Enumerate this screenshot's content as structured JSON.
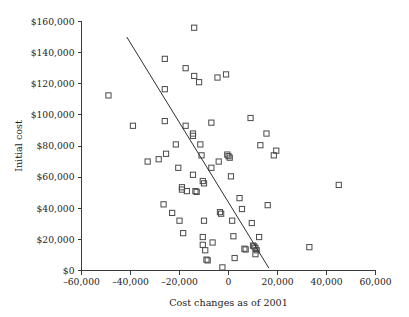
{
  "chart_data": {
    "type": "scatter",
    "title": "",
    "xlabel": "Cost changes as of 2001",
    "ylabel": "Initial cost",
    "xlim": [
      -60000,
      60000
    ],
    "ylim": [
      0,
      160000
    ],
    "grid": false,
    "legend": null,
    "xticks": [
      -60000,
      -40000,
      -20000,
      0,
      20000,
      40000,
      60000
    ],
    "xticklabels": [
      "–60,000",
      "–40,000",
      "–20,000",
      "0",
      "20,000",
      "40,000",
      "60,000"
    ],
    "yticks": [
      0,
      20000,
      40000,
      60000,
      80000,
      100000,
      120000,
      140000,
      160000
    ],
    "yticklabels": [
      "$0",
      "$20,000",
      "$40,000",
      "$60,000",
      "$80,000",
      "$100,000",
      "$120,000",
      "$140,000",
      "$160,000"
    ],
    "marker": "open-square",
    "marker_color": "#4a4a4a",
    "trendline": {
      "show": true,
      "x_start": -41500,
      "y_start": 150000,
      "x_end": 16500,
      "y_end": 1500,
      "color": "#2e2e2e"
    },
    "points": [
      {
        "x": -49000,
        "y": 112500
      },
      {
        "x": -39000,
        "y": 93000
      },
      {
        "x": -33000,
        "y": 70000
      },
      {
        "x": -28500,
        "y": 71500
      },
      {
        "x": -26000,
        "y": 136000
      },
      {
        "x": -26000,
        "y": 116500
      },
      {
        "x": -26000,
        "y": 96000
      },
      {
        "x": -25500,
        "y": 75000
      },
      {
        "x": -26500,
        "y": 42500
      },
      {
        "x": -23000,
        "y": 37000
      },
      {
        "x": -21500,
        "y": 81000
      },
      {
        "x": -20500,
        "y": 66000
      },
      {
        "x": -20000,
        "y": 32000
      },
      {
        "x": -19000,
        "y": 53500
      },
      {
        "x": -19000,
        "y": 52000
      },
      {
        "x": -17500,
        "y": 130000
      },
      {
        "x": -17500,
        "y": 93000
      },
      {
        "x": -17000,
        "y": 51000
      },
      {
        "x": -18500,
        "y": 24000
      },
      {
        "x": -14000,
        "y": 156000
      },
      {
        "x": -14000,
        "y": 125000
      },
      {
        "x": -14500,
        "y": 88000
      },
      {
        "x": -14500,
        "y": 86500
      },
      {
        "x": -14500,
        "y": 61500
      },
      {
        "x": -13500,
        "y": 51000
      },
      {
        "x": -13000,
        "y": 50500
      },
      {
        "x": -12000,
        "y": 121000
      },
      {
        "x": -11500,
        "y": 81000
      },
      {
        "x": -11000,
        "y": 74000
      },
      {
        "x": -10500,
        "y": 57500
      },
      {
        "x": -10000,
        "y": 56000
      },
      {
        "x": -10000,
        "y": 32000
      },
      {
        "x": -10500,
        "y": 21500
      },
      {
        "x": -10500,
        "y": 16500
      },
      {
        "x": -9500,
        "y": 13000
      },
      {
        "x": -9000,
        "y": 7000
      },
      {
        "x": -8500,
        "y": 6500
      },
      {
        "x": -7000,
        "y": 95000
      },
      {
        "x": -7000,
        "y": 66000
      },
      {
        "x": -6500,
        "y": 18000
      },
      {
        "x": -4500,
        "y": 124000
      },
      {
        "x": -4000,
        "y": 70000
      },
      {
        "x": -3500,
        "y": 37500
      },
      {
        "x": -3000,
        "y": 36500
      },
      {
        "x": -2500,
        "y": 2000
      },
      {
        "x": -1000,
        "y": 126000
      },
      {
        "x": -500,
        "y": 74500
      },
      {
        "x": 0,
        "y": 73500
      },
      {
        "x": 500,
        "y": 72500
      },
      {
        "x": 1000,
        "y": 60500
      },
      {
        "x": 1500,
        "y": 32000
      },
      {
        "x": 2000,
        "y": 22000
      },
      {
        "x": 2500,
        "y": 8000
      },
      {
        "x": 4500,
        "y": 46500
      },
      {
        "x": 5500,
        "y": 39500
      },
      {
        "x": 6500,
        "y": 14000
      },
      {
        "x": 7000,
        "y": 13500
      },
      {
        "x": 9000,
        "y": 98000
      },
      {
        "x": 9500,
        "y": 30500
      },
      {
        "x": 10000,
        "y": 16000
      },
      {
        "x": 10500,
        "y": 15500
      },
      {
        "x": 11000,
        "y": 14500
      },
      {
        "x": 11000,
        "y": 10500
      },
      {
        "x": 11500,
        "y": 13000
      },
      {
        "x": 12500,
        "y": 21500
      },
      {
        "x": 13000,
        "y": 80500
      },
      {
        "x": 15500,
        "y": 88000
      },
      {
        "x": 16000,
        "y": 42000
      },
      {
        "x": 18500,
        "y": 74000
      },
      {
        "x": 19500,
        "y": 77000
      },
      {
        "x": 33000,
        "y": 15000
      },
      {
        "x": 45000,
        "y": 55000
      }
    ]
  }
}
